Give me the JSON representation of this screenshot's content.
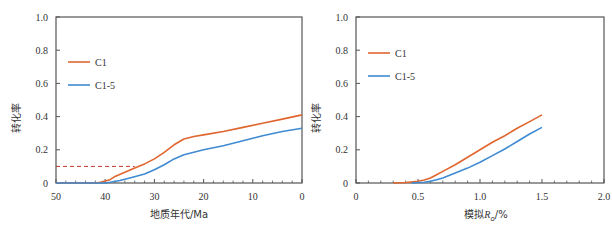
{
  "chart_data": [
    {
      "type": "line",
      "id": "left",
      "title": "",
      "xlabel": "地质年代/Ma",
      "ylabel": "转化率",
      "xlim": [
        50,
        0
      ],
      "ylim": [
        0,
        1.0
      ],
      "x_ticks": [
        "50",
        "40",
        "30",
        "20",
        "10",
        "0"
      ],
      "x_tick_values": [
        50,
        40,
        30,
        20,
        10,
        0
      ],
      "y_ticks": [
        "0",
        "0.2",
        "0.4",
        "0.6",
        "0.8",
        "1.0"
      ],
      "y_tick_values": [
        0,
        0.2,
        0.4,
        0.6,
        0.8,
        1.0
      ],
      "grid": false,
      "legend_position": "upper left",
      "legend": [
        "C1",
        "C1-5"
      ],
      "series": [
        {
          "name": "C1",
          "color": "#e0662f",
          "x": [
            50,
            42,
            41,
            39,
            38,
            36,
            34,
            32,
            30,
            28,
            26,
            24,
            22,
            20,
            16,
            12,
            8,
            4,
            0
          ],
          "y": [
            0,
            0,
            0.004,
            0.02,
            0.04,
            0.065,
            0.09,
            0.115,
            0.145,
            0.185,
            0.23,
            0.265,
            0.28,
            0.29,
            0.31,
            0.335,
            0.36,
            0.385,
            0.41
          ]
        },
        {
          "name": "C1-5",
          "color": "#3f8ad2",
          "x": [
            50,
            40,
            39,
            37,
            35,
            32,
            30,
            28,
            26,
            24,
            22,
            20,
            16,
            12,
            8,
            4,
            0
          ],
          "y": [
            0,
            0,
            0.004,
            0.015,
            0.03,
            0.055,
            0.08,
            0.11,
            0.145,
            0.17,
            0.185,
            0.2,
            0.225,
            0.255,
            0.285,
            0.31,
            0.33
          ]
        }
      ],
      "annotations": [
        {
          "type": "dashed-line",
          "color": "#c0392b",
          "x": [
            50,
            34
          ],
          "y": [
            0.1,
            0.1
          ],
          "note": "horizontal reference at conversion 0.1"
        }
      ]
    },
    {
      "type": "line",
      "id": "right",
      "title": "",
      "xlabel": "模拟R_o/%",
      "xlabel_main": "模拟",
      "xlabel_var": "R",
      "xlabel_sub": "o",
      "xlabel_unit": "/%",
      "ylabel": "转化率",
      "xlim": [
        0,
        2.0
      ],
      "ylim": [
        0,
        1.0
      ],
      "x_ticks": [
        "0",
        "0.5",
        "1.0",
        "1.5",
        "2.0"
      ],
      "x_tick_values": [
        0,
        0.5,
        1.0,
        1.5,
        2.0
      ],
      "y_ticks": [
        "0",
        "0.2",
        "0.4",
        "0.6",
        "0.8",
        "1.0"
      ],
      "y_tick_values": [
        0,
        0.2,
        0.4,
        0.6,
        0.8,
        1.0
      ],
      "grid": false,
      "legend_position": "upper left",
      "legend": [
        "C1",
        "C1-5"
      ],
      "series": [
        {
          "name": "C1",
          "color": "#e0662f",
          "x": [
            0.3,
            0.4,
            0.5,
            0.55,
            0.6,
            0.65,
            0.7,
            0.8,
            0.9,
            1.0,
            1.1,
            1.2,
            1.3,
            1.4,
            1.5
          ],
          "y": [
            0,
            0.003,
            0.01,
            0.018,
            0.03,
            0.05,
            0.07,
            0.11,
            0.155,
            0.2,
            0.245,
            0.285,
            0.33,
            0.37,
            0.41
          ]
        },
        {
          "name": "C1-5",
          "color": "#3f8ad2",
          "x": [
            0.45,
            0.55,
            0.6,
            0.65,
            0.7,
            0.8,
            0.9,
            1.0,
            1.1,
            1.2,
            1.3,
            1.4,
            1.5
          ],
          "y": [
            0,
            0.004,
            0.01,
            0.02,
            0.03,
            0.06,
            0.09,
            0.125,
            0.165,
            0.205,
            0.25,
            0.295,
            0.335
          ]
        }
      ],
      "annotations": []
    }
  ],
  "layout": {
    "panels": [
      {
        "id": "left",
        "x0": 56,
        "x1": 302,
        "y_top": 17,
        "y_bottom": 183
      },
      {
        "id": "right",
        "x0": 356,
        "x1": 604,
        "y_top": 17,
        "y_bottom": 183
      }
    ],
    "axis_color": "#555555"
  }
}
